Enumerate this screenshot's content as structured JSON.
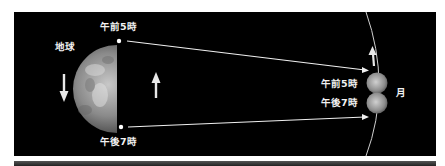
{
  "labels": {
    "earth": "地球",
    "moon": "月",
    "morning_point": "午前5時",
    "evening_point": "午後7時",
    "moon_morning": "午前5時",
    "moon_evening": "午後7時"
  },
  "colors": {
    "background": "#000000",
    "page": "#ffffff",
    "line": "#f0f0f0",
    "earth_light": "#b8b8b8",
    "earth_dark": "#4a4a4a"
  }
}
